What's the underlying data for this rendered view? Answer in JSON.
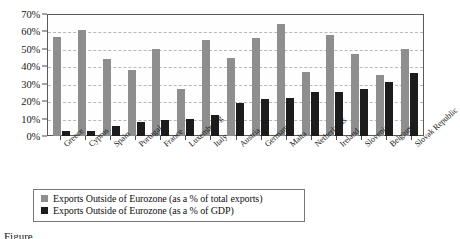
{
  "chart_data": {
    "type": "bar",
    "title": "",
    "xlabel": "",
    "ylabel": "",
    "ylim": [
      0,
      70
    ],
    "ytick_labels": [
      "0%",
      "10%",
      "20%",
      "30%",
      "40%",
      "50%",
      "60%",
      "70%"
    ],
    "ytick_values": [
      0,
      10,
      20,
      30,
      40,
      50,
      60,
      70
    ],
    "grid": true,
    "legend_position": "bottom-left",
    "categories": [
      "Greece",
      "Cyprus",
      "Spain",
      "Portugal",
      "France",
      "Luxembourg",
      "Italy",
      "Austria",
      "Germany",
      "Malta",
      "Netherlands",
      "Ireland",
      "Slovenia",
      "Belgium",
      "Slovak Republic"
    ],
    "series": [
      {
        "name": "Exports Outside of Eurozone (as a % of total exports)",
        "color": "#8e8e8e",
        "values": [
          57,
          61,
          44,
          38,
          50,
          27,
          55,
          45,
          56,
          64,
          37,
          58,
          47,
          35,
          50
        ]
      },
      {
        "name": "Exports Outside of Eurozone (as a % of GDP)",
        "color": "#1c1c1c",
        "values": [
          3,
          3,
          6,
          8,
          9,
          10,
          12,
          19,
          21,
          22,
          25,
          25,
          27,
          31,
          36
        ]
      }
    ]
  },
  "legend": {
    "items": [
      {
        "label": "Exports Outside of Eurozone (as a % of total exports)"
      },
      {
        "label": "Exports Outside of Eurozone (as a % of GDP)"
      }
    ]
  },
  "caption": {
    "partial_text": "Figure"
  }
}
